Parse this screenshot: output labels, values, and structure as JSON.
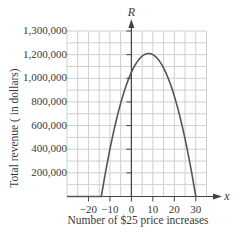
{
  "chart_data": {
    "type": "line",
    "title": "",
    "xlabel": "Number of $25 price increases",
    "ylabel": "Total revenue ( in dollars)",
    "x_axis_name": "x",
    "y_axis_name": "R",
    "xlim": [
      -30,
      35
    ],
    "ylim": [
      0,
      1400000
    ],
    "grid": true,
    "x_grid_step": 5,
    "y_grid_step": 100000,
    "x_ticks": [
      {
        "value": -20,
        "label": "−20"
      },
      {
        "value": -10,
        "label": "−10"
      },
      {
        "value": 0,
        "label": "0"
      },
      {
        "value": 10,
        "label": "10"
      },
      {
        "value": 20,
        "label": "20"
      },
      {
        "value": 30,
        "label": "30"
      }
    ],
    "y_ticks": [
      {
        "value": 200000,
        "label": "200,000"
      },
      {
        "value": 400000,
        "label": "400,000"
      },
      {
        "value": 600000,
        "label": "600,000"
      },
      {
        "value": 800000,
        "label": "800,000"
      },
      {
        "value": 1000000,
        "label": "1,000,000"
      },
      {
        "value": 1200000,
        "label": "1,200,000"
      },
      {
        "value": 1400000,
        "label": "1,300,000"
      }
    ],
    "series": [
      {
        "name": "R",
        "description": "Revenue parabola, zero outside roots",
        "x": [
          -30,
          -14,
          -10,
          -5,
          0,
          5,
          8,
          10,
          15,
          20,
          25,
          30
        ],
        "values": [
          0,
          0,
          400000,
          675000,
          1050000,
          1187500,
          1210000,
          1200000,
          1087500,
          850000,
          487500,
          0
        ]
      }
    ],
    "roots": [
      -14,
      30
    ],
    "vertex": {
      "x": 8,
      "y": 1210000
    },
    "r_intercept": 1050000
  },
  "colors": {
    "grid": "#cfcfcf",
    "axis": "#444444",
    "curve": "#555555",
    "text": "#3a3a3a"
  }
}
